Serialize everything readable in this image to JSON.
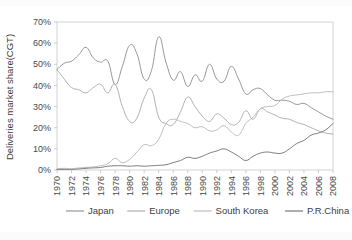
{
  "chart_data": {
    "type": "line",
    "title": "",
    "subtitle": "",
    "xlabel": "",
    "ylabel": "Deliveries market share(CGT)",
    "xlim": [
      1970,
      2008
    ],
    "ylim": [
      0,
      70
    ],
    "grid": false,
    "legend_position": "bottom",
    "x_tick_labels": [
      "1970",
      "1972",
      "1974",
      "1976",
      "1978",
      "1980",
      "1982",
      "1984",
      "1986",
      "1988",
      "1990",
      "1992",
      "1994",
      "1996",
      "1998",
      "2000",
      "2002",
      "2004",
      "2006",
      "2008"
    ],
    "y_tick_labels": [
      "0%",
      "10%",
      "20%",
      "30%",
      "40%",
      "50%",
      "60%",
      "70%"
    ],
    "y_tick_values": [
      0,
      10,
      20,
      30,
      40,
      50,
      60,
      70
    ],
    "x": [
      1970,
      1971,
      1972,
      1973,
      1974,
      1975,
      1976,
      1977,
      1978,
      1979,
      1980,
      1981,
      1982,
      1983,
      1984,
      1985,
      1986,
      1987,
      1988,
      1989,
      1990,
      1991,
      1992,
      1993,
      1994,
      1995,
      1996,
      1997,
      1998,
      1999,
      2000,
      2001,
      2002,
      2003,
      2004,
      2005,
      2006,
      2007,
      2008
    ],
    "series": [
      {
        "name": "Japan",
        "color": "#8c8c8c",
        "values": [
          47.5,
          50.5,
          51.5,
          54.5,
          58.0,
          53.0,
          51.0,
          51.5,
          40.5,
          49.0,
          59.0,
          55.0,
          43.0,
          47.0,
          63.0,
          51.0,
          42.5,
          46.5,
          39.5,
          45.0,
          42.0,
          50.0,
          43.0,
          42.0,
          49.0,
          43.0,
          36.0,
          38.0,
          38.5,
          35.5,
          33.0,
          33.0,
          32.5,
          31.0,
          31.5,
          29.5,
          27.5,
          25.5,
          24.0
        ]
      },
      {
        "name": "Europe",
        "color": "#a8a8a8",
        "values": [
          47.5,
          43.0,
          39.0,
          38.0,
          36.5,
          39.0,
          40.5,
          36.5,
          40.5,
          30.0,
          23.0,
          24.5,
          34.0,
          38.0,
          25.0,
          22.0,
          21.5,
          27.5,
          34.5,
          30.0,
          25.5,
          23.0,
          26.5,
          24.5,
          21.5,
          22.5,
          28.0,
          24.0,
          29.0,
          27.5,
          26.0,
          24.5,
          24.0,
          22.5,
          21.5,
          20.0,
          18.5,
          17.5,
          17.0
        ]
      },
      {
        "name": "South Korea",
        "color": "#b8b8b8",
        "values": [
          0.5,
          0.8,
          0.6,
          1.0,
          1.2,
          1.5,
          2.0,
          3.0,
          5.5,
          3.5,
          5.0,
          8.5,
          12.0,
          11.5,
          14.5,
          22.0,
          24.0,
          23.0,
          22.0,
          20.0,
          20.5,
          18.5,
          19.0,
          21.0,
          18.0,
          16.5,
          22.0,
          25.0,
          29.0,
          30.0,
          30.5,
          33.5,
          35.0,
          35.5,
          36.0,
          36.5,
          36.5,
          37.0,
          37.0
        ]
      },
      {
        "name": "P.R.China",
        "color": "#6e6e6e",
        "values": [
          0.3,
          0.3,
          0.3,
          0.5,
          0.8,
          1.0,
          1.2,
          1.8,
          2.0,
          2.0,
          1.8,
          2.0,
          1.8,
          2.0,
          2.2,
          2.5,
          3.5,
          4.5,
          6.0,
          5.5,
          6.5,
          8.0,
          9.0,
          10.0,
          8.5,
          6.5,
          4.5,
          6.5,
          8.0,
          8.5,
          8.0,
          8.0,
          10.0,
          12.5,
          14.0,
          16.5,
          17.5,
          19.0,
          22.0
        ]
      }
    ]
  },
  "legend": {
    "items": [
      {
        "label": "Japan",
        "color": "#8c8c8c"
      },
      {
        "label": "Europe",
        "color": "#a8a8a8"
      },
      {
        "label": "South Korea",
        "color": "#b8b8b8"
      },
      {
        "label": "P.R.China",
        "color": "#6e6e6e"
      }
    ]
  },
  "axes": {
    "ylabel": "Deliveries market share(CGT)"
  }
}
